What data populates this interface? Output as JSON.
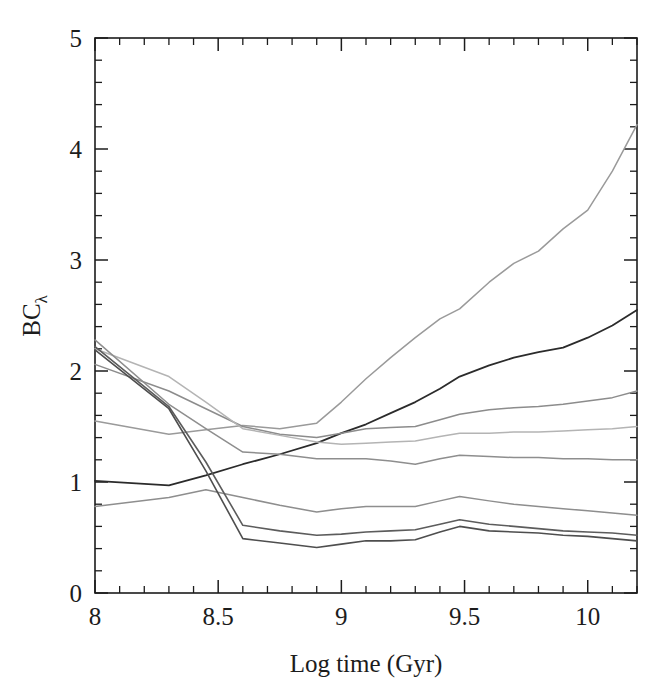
{
  "figure": {
    "background_color": "#ffffff",
    "ink_color": "#1c1c1c",
    "y_axis_label_main": "BC",
    "y_axis_label_sub": "λ",
    "x_axis_label": "Log time (Gyr)"
  },
  "axes": {
    "x_major_labels": [
      "8",
      "8.5",
      "9",
      "9.5",
      "10"
    ],
    "x_major_values": [
      8,
      8.5,
      9,
      9.5,
      10
    ],
    "y_major_labels": [
      "0",
      "1",
      "2",
      "3",
      "4",
      "5"
    ],
    "y_major_values": [
      0,
      1,
      2,
      3,
      4,
      5
    ],
    "x_minor_step": 0.1,
    "y_minor_step": 0.2,
    "xlim": [
      8.0,
      10.2
    ],
    "ylim": [
      0,
      5
    ],
    "ticks_inward": true,
    "frame": "box"
  },
  "chart_data": {
    "type": "line",
    "title": "",
    "xlabel": "Log time (Gyr)",
    "ylabel": "BCλ",
    "xlim": [
      8.0,
      10.2
    ],
    "ylim": [
      0,
      5
    ],
    "grid": false,
    "legend": "none",
    "x": [
      8.0,
      8.3,
      8.45,
      8.6,
      8.75,
      8.9,
      9.0,
      9.1,
      9.2,
      9.3,
      9.4,
      9.48,
      9.6,
      9.7,
      9.8,
      9.9,
      10.0,
      10.1,
      10.2
    ],
    "series": [
      {
        "name": "curve-1-steep-rise",
        "color": "#9a9a9a",
        "width": 1.5,
        "values": [
          1.55,
          1.43,
          1.47,
          1.51,
          1.48,
          1.53,
          1.72,
          1.93,
          2.12,
          2.3,
          2.47,
          2.56,
          2.8,
          2.97,
          3.08,
          3.28,
          3.45,
          3.8,
          4.22
        ]
      },
      {
        "name": "curve-2-dark-rise",
        "color": "#2b2b2b",
        "width": 1.8,
        "values": [
          1.01,
          0.97,
          1.06,
          1.16,
          1.25,
          1.35,
          1.44,
          1.52,
          1.62,
          1.72,
          1.84,
          1.95,
          2.05,
          2.12,
          2.17,
          2.21,
          2.3,
          2.41,
          2.55
        ]
      },
      {
        "name": "curve-3-shallow-rise",
        "color": "#8c8c8c",
        "width": 1.5,
        "values": [
          2.06,
          1.82,
          1.66,
          1.5,
          1.43,
          1.4,
          1.44,
          1.48,
          1.49,
          1.5,
          1.56,
          1.61,
          1.65,
          1.67,
          1.68,
          1.7,
          1.73,
          1.76,
          1.82
        ]
      },
      {
        "name": "curve-4-flat-mid",
        "color": "#b4b4b4",
        "width": 1.5,
        "values": [
          2.2,
          1.95,
          1.72,
          1.48,
          1.42,
          1.36,
          1.34,
          1.35,
          1.36,
          1.37,
          1.41,
          1.44,
          1.44,
          1.45,
          1.45,
          1.46,
          1.47,
          1.48,
          1.5
        ]
      },
      {
        "name": "curve-5-flat-low",
        "color": "#8e8e8e",
        "width": 1.5,
        "values": [
          2.28,
          1.7,
          1.48,
          1.27,
          1.25,
          1.21,
          1.21,
          1.21,
          1.19,
          1.16,
          1.21,
          1.24,
          1.23,
          1.22,
          1.22,
          1.21,
          1.21,
          1.2,
          1.2
        ]
      },
      {
        "name": "curve-6-upper-low",
        "color": "#8e8e8e",
        "width": 1.5,
        "values": [
          0.78,
          0.86,
          0.93,
          0.86,
          0.79,
          0.73,
          0.76,
          0.78,
          0.78,
          0.78,
          0.83,
          0.87,
          0.83,
          0.8,
          0.78,
          0.76,
          0.74,
          0.72,
          0.7
        ]
      },
      {
        "name": "curve-7-middle-low",
        "color": "#5c5c5c",
        "width": 1.6,
        "values": [
          2.22,
          1.68,
          1.18,
          0.61,
          0.56,
          0.52,
          0.53,
          0.55,
          0.56,
          0.57,
          0.62,
          0.66,
          0.62,
          0.6,
          0.58,
          0.56,
          0.55,
          0.54,
          0.52
        ]
      },
      {
        "name": "curve-8-lowest",
        "color": "#4e4e4e",
        "width": 1.6,
        "values": [
          2.19,
          1.66,
          1.1,
          0.49,
          0.45,
          0.41,
          0.44,
          0.47,
          0.47,
          0.48,
          0.55,
          0.6,
          0.56,
          0.55,
          0.54,
          0.52,
          0.51,
          0.49,
          0.47
        ]
      }
    ]
  }
}
